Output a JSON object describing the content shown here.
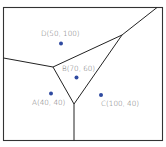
{
  "diagram": {
    "type": "voronoi",
    "frame": {
      "x": 3.5,
      "y": 7.5,
      "width": 159,
      "height": 133,
      "stroke": "#333333"
    },
    "edge_color": "#222222",
    "point_color": "#2f4aa0",
    "label_color": "#6e6e6e",
    "points": [
      {
        "id": "D",
        "label": "D(50, 100)",
        "x": 50,
        "y": 100
      },
      {
        "id": "B",
        "label": "B(70, 60)",
        "x": 70,
        "y": 60
      },
      {
        "id": "A",
        "label": "A(40, 40)",
        "x": 40,
        "y": 40
      },
      {
        "id": "C",
        "label": "C(100, 40)",
        "x": 100,
        "y": 40
      }
    ]
  }
}
